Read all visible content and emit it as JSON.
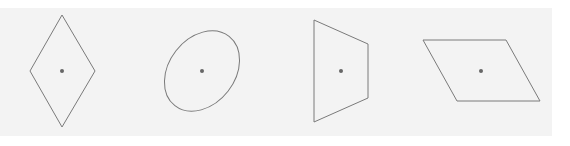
{
  "colors": {
    "background": "#ffffff",
    "panel": "#f3f3f3",
    "stroke": "#7a7a7a",
    "center_dot": "#666666"
  },
  "shapes": [
    {
      "name": "rhombus",
      "type": "polygon",
      "points": "62,15 95,71 62,127 30,71",
      "center": [
        62,
        71
      ]
    },
    {
      "name": "ellipse",
      "type": "ellipse",
      "cx": 202,
      "cy": 71,
      "rx": 44,
      "ry": 33,
      "rotate": -52,
      "center": [
        202,
        71
      ]
    },
    {
      "name": "trapezoid",
      "type": "polygon",
      "points": "314,20 368,44 368,98 314,122",
      "center": [
        341,
        71
      ]
    },
    {
      "name": "parallelogram",
      "type": "polygon",
      "points": "423,40 506,40 540,101 457,101",
      "center": [
        481,
        71
      ]
    }
  ]
}
